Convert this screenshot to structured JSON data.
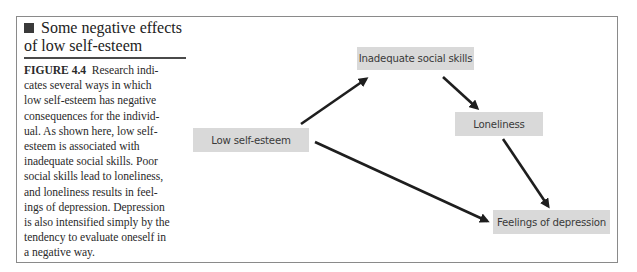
{
  "caption": {
    "title": "Some negative effects of low self-esteem",
    "title_icon": "black-square-bullet",
    "figure_label": "FIGURE 4.4",
    "body_lines": [
      "Research indi-",
      "cates several ways in which",
      "low self-esteem has negative",
      "consequences for the individ-",
      "ual. As shown here, low self-",
      "esteem is associated with",
      "inadequate social skills. Poor",
      "social skills lead to loneliness,",
      "and loneliness results in feel-",
      "ings of depression. Depression",
      "is also intensified simply by the",
      "tendency to evaluate oneself in",
      "a negative way."
    ]
  },
  "diagram": {
    "nodes": [
      {
        "id": "low_self_esteem",
        "label": "Low self-esteem"
      },
      {
        "id": "inadequate_social_skills",
        "label": "Inadequate social skills"
      },
      {
        "id": "loneliness",
        "label": "Loneliness"
      },
      {
        "id": "feelings_of_depression",
        "label": "Feelings of depression"
      }
    ],
    "edges": [
      {
        "from": "low_self_esteem",
        "to": "inadequate_social_skills"
      },
      {
        "from": "inadequate_social_skills",
        "to": "loneliness"
      },
      {
        "from": "loneliness",
        "to": "feelings_of_depression"
      },
      {
        "from": "low_self_esteem",
        "to": "feelings_of_depression"
      }
    ],
    "colors": {
      "node_fill": "#d9d9d9",
      "arrow": "#1e1e1e",
      "frame": "#8a8a8a"
    }
  }
}
